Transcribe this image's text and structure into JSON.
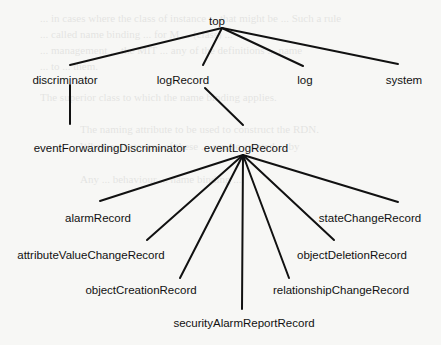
{
  "diagram": {
    "type": "tree",
    "title": "",
    "nodes": [
      {
        "id": "top",
        "label": "top",
        "x": 217,
        "y": 25
      },
      {
        "id": "discriminator",
        "label": "discriminator",
        "x": 65,
        "y": 84
      },
      {
        "id": "logRecord",
        "label": "logRecord",
        "x": 183,
        "y": 84
      },
      {
        "id": "log",
        "label": "log",
        "x": 305,
        "y": 84
      },
      {
        "id": "system",
        "label": "system",
        "x": 404,
        "y": 84
      },
      {
        "id": "eventForwardingDiscriminator",
        "label": "eventForwardingDiscriminator",
        "x": 110,
        "y": 152
      },
      {
        "id": "eventLogRecord",
        "label": "eventLogRecord",
        "x": 246,
        "y": 152
      },
      {
        "id": "alarmRecord",
        "label": "alarmRecord",
        "x": 98,
        "y": 222
      },
      {
        "id": "stateChangeRecord",
        "label": "stateChangeRecord",
        "x": 370,
        "y": 222
      },
      {
        "id": "attributeValueChangeRecord",
        "label": "attributeValueChangeRecord",
        "x": 91,
        "y": 259
      },
      {
        "id": "objectDeletionRecord",
        "label": "objectDeletionRecord",
        "x": 352,
        "y": 259
      },
      {
        "id": "objectCreationRecord",
        "label": "objectCreationRecord",
        "x": 141,
        "y": 294
      },
      {
        "id": "relationshipChangeRecord",
        "label": "relationshipChangeRecord",
        "x": 341,
        "y": 294
      },
      {
        "id": "securityAlarmReportRecord",
        "label": "securityAlarmReportRecord",
        "x": 244,
        "y": 327
      }
    ],
    "edges": [
      {
        "from": "top",
        "to": "discriminator",
        "x1": 222,
        "y1": 28,
        "x2": 70,
        "y2": 65
      },
      {
        "from": "top",
        "to": "logRecord",
        "x1": 222,
        "y1": 28,
        "x2": 203,
        "y2": 65
      },
      {
        "from": "top",
        "to": "log",
        "x1": 222,
        "y1": 28,
        "x2": 303,
        "y2": 66
      },
      {
        "from": "top",
        "to": "system",
        "x1": 222,
        "y1": 28,
        "x2": 398,
        "y2": 64
      },
      {
        "from": "discriminator",
        "to": "eventForwardingDiscriminator",
        "x1": 70,
        "y1": 85,
        "x2": 70,
        "y2": 124
      },
      {
        "from": "logRecord",
        "to": "eventLogRecord",
        "x1": 205,
        "y1": 88,
        "x2": 243,
        "y2": 125
      },
      {
        "from": "eventLogRecord",
        "to": "alarmRecord",
        "x1": 243,
        "y1": 155,
        "x2": 100,
        "y2": 201
      },
      {
        "from": "eventLogRecord",
        "to": "stateChangeRecord",
        "x1": 243,
        "y1": 155,
        "x2": 398,
        "y2": 202
      },
      {
        "from": "eventLogRecord",
        "to": "attributeValueChangeRecord",
        "x1": 243,
        "y1": 155,
        "x2": 147,
        "y2": 240
      },
      {
        "from": "eventLogRecord",
        "to": "objectDeletionRecord",
        "x1": 243,
        "y1": 155,
        "x2": 334,
        "y2": 240
      },
      {
        "from": "eventLogRecord",
        "to": "objectCreationRecord",
        "x1": 243,
        "y1": 155,
        "x2": 180,
        "y2": 278
      },
      {
        "from": "eventLogRecord",
        "to": "relationshipChangeRecord",
        "x1": 243,
        "y1": 155,
        "x2": 289,
        "y2": 278
      },
      {
        "from": "eventLogRecord",
        "to": "securityAlarmReportRecord",
        "x1": 243,
        "y1": 155,
        "x2": 242,
        "y2": 309
      }
    ]
  },
  "background_text": [
    {
      "text": "... in cases where the class of instance ... that might be ... Such a rule",
      "x": 40,
      "y": 12
    },
    {
      "text": "... called name binding ... for M ... (class) ...",
      "x": 40,
      "y": 28
    },
    {
      "text": "... management ... the MIT ... any of the definitions ... name",
      "x": 40,
      "y": 44
    },
    {
      "text": "... to ... them.",
      "x": 40,
      "y": 60
    },
    {
      "text": "The superior class to which the name binding applies.",
      "x": 40,
      "y": 91
    },
    {
      "text": "The naming attribute to be used to construct the RDN.",
      "x": 80,
      "y": 123
    },
    {
      "text": "Whether instances of these ... can be created ... by",
      "x": 80,
      "y": 140
    },
    {
      "text": "Any ... behaviour ... name binding ...",
      "x": 80,
      "y": 173
    }
  ],
  "colors": {
    "background": "#f7f7f5",
    "ink": "#111111"
  }
}
